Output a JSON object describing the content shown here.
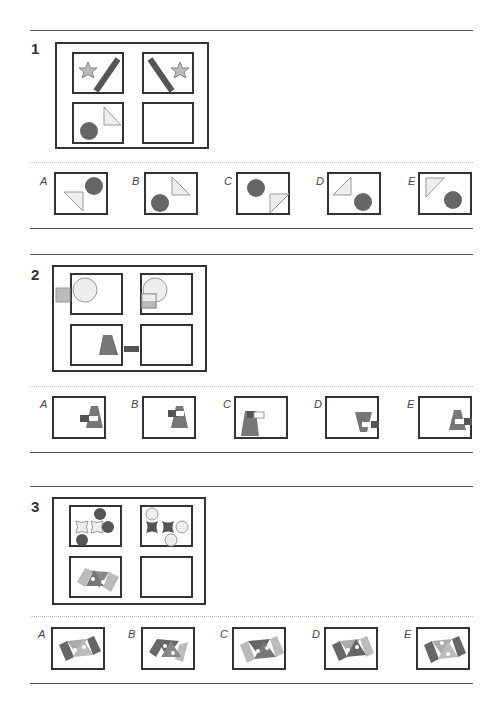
{
  "colors": {
    "line": "#555555",
    "border": "#333333",
    "dark_fill": "#666666",
    "mid_fill": "#8a8a8a",
    "light_fill": "#bbbbbb",
    "pale_fill": "#eeeeee",
    "shape_stroke": "#999999"
  },
  "questions": [
    {
      "number": "1",
      "matrix": [
        "star-left-slash-right",
        "backslash-left-star-right",
        "circle-bottomleft-triangle-topright",
        "empty"
      ],
      "options": [
        {
          "label": "A",
          "description": "triangle lower-left, circle upper-right"
        },
        {
          "label": "B",
          "description": "circle lower-left, triangle upper-right"
        },
        {
          "label": "C",
          "description": "circle upper-left, triangle lower-right"
        },
        {
          "label": "D",
          "description": "triangle upper-left, circle lower-right"
        },
        {
          "label": "E",
          "description": "triangle upper-left pointing down, circle lower-right"
        }
      ]
    },
    {
      "number": "2",
      "matrix": [
        "square-outside-left-circle",
        "square-inside-circle",
        "trapezoid-bar-outside",
        "empty"
      ],
      "options": [
        {
          "label": "A",
          "description": "trapezoid right with bar inside left"
        },
        {
          "label": "B",
          "description": "trapezoid right with bar top-left"
        },
        {
          "label": "C",
          "description": "trapezoid left with outline bar"
        },
        {
          "label": "D",
          "description": "inverted trapezoid with bar right edge"
        },
        {
          "label": "E",
          "description": "trapezoid right edge with bar"
        }
      ]
    },
    {
      "number": "3",
      "matrix": [
        "light-crosses-dark-circles",
        "dark-crosses-light-circles",
        "triangles-parallelograms",
        "empty"
      ],
      "options": [
        {
          "label": "A",
          "description": "dark sides, light triangles"
        },
        {
          "label": "B",
          "description": "dark left, light right, dark triangles"
        },
        {
          "label": "C",
          "description": "light sides, dark triangles"
        },
        {
          "label": "D",
          "description": "dark left, light right, mixed"
        },
        {
          "label": "E",
          "description": "dark sides, light triangles, dots offset"
        }
      ]
    }
  ]
}
